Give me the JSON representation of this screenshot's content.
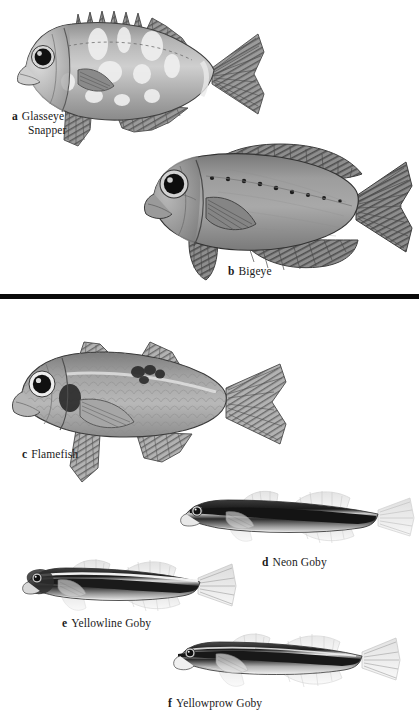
{
  "plate": {
    "width": 419,
    "height": 713,
    "background": "#ffffff",
    "divider_color": "#0a0a0a",
    "style": "grayscale scientific illustration field-guide plate",
    "sections": 2
  },
  "figures": [
    {
      "letter": "a",
      "name": "Glasseye Snapper",
      "caption_x": 12,
      "caption_y": 110,
      "multiline": true,
      "line1": "Glasseye",
      "line2": "Snapper",
      "section": 1,
      "traits": "deep-bodied, large dark eye, pale mottled blotches, spiny dorsal fin, forked tail"
    },
    {
      "letter": "b",
      "name": "Bigeye",
      "caption_x": 228,
      "caption_y": 265,
      "multiline": false,
      "section": 1,
      "traits": "deep-bodied, very large dark eye, row of dark dots along lateral line, forked tail"
    },
    {
      "letter": "c",
      "name": "Flamefish",
      "caption_x": 22,
      "caption_y": 448,
      "multiline": false,
      "section": 2,
      "traits": "cardinalfish body, large eye with white ring, dark shoulder blotch, dark saddle near tail base"
    },
    {
      "letter": "d",
      "name": "Neon Goby",
      "caption_x": 262,
      "caption_y": 556,
      "multiline": false,
      "section": 2,
      "traits": "slender elongate goby, bold dark lateral stripe, pale belly, translucent fins"
    },
    {
      "letter": "e",
      "name": "Yellowline Goby",
      "caption_x": 62,
      "caption_y": 617,
      "multiline": false,
      "section": 2,
      "traits": "slender goby, dark lateral stripe with pale line above, translucent fins"
    },
    {
      "letter": "f",
      "name": "Yellowprow Goby",
      "caption_x": 168,
      "caption_y": 697,
      "multiline": false,
      "section": 2,
      "traits": "slender goby, dark stripe from snout through eye to tail, pale lower body"
    }
  ],
  "divider": {
    "y": 294,
    "thickness": 5
  }
}
